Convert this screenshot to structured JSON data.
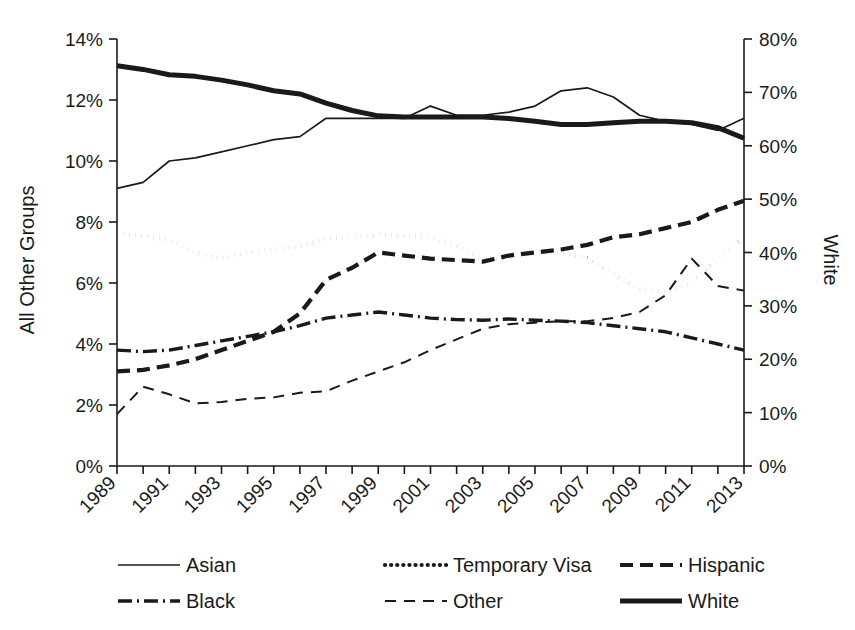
{
  "chart_data": {
    "type": "line",
    "title": "",
    "xlabel": "",
    "ylabel": "All Other Groups",
    "y2label": "White",
    "grid": false,
    "legend_position": "bottom",
    "x": [
      1989,
      1990,
      1991,
      1992,
      1993,
      1994,
      1995,
      1996,
      1997,
      1998,
      1999,
      2000,
      2001,
      2002,
      2003,
      2004,
      2005,
      2006,
      2007,
      2008,
      2009,
      2010,
      2011,
      2012,
      2013
    ],
    "xtick_labels": [
      "1989",
      "1991",
      "1993",
      "1995",
      "1997",
      "1999",
      "2001",
      "2003",
      "2005",
      "2007",
      "2009",
      "2011",
      "2013"
    ],
    "xlim": [
      1989,
      2013
    ],
    "ylim": [
      0,
      14
    ],
    "ytick_labels": [
      "0%",
      "2%",
      "4%",
      "6%",
      "8%",
      "10%",
      "12%",
      "14%"
    ],
    "ytick_values": [
      0,
      2,
      4,
      6,
      8,
      10,
      12,
      14
    ],
    "y2lim": [
      0,
      80
    ],
    "y2tick_labels": [
      "0%",
      "10%",
      "20%",
      "30%",
      "40%",
      "50%",
      "60%",
      "70%",
      "80%"
    ],
    "y2tick_values": [
      0,
      10,
      20,
      30,
      40,
      50,
      60,
      70,
      80
    ],
    "series": [
      {
        "name": "Asian",
        "axis": "left",
        "style": "solid-thin",
        "stroke_width": 1.7,
        "dash": "none",
        "values": [
          9.1,
          9.3,
          10.0,
          10.1,
          10.3,
          10.5,
          10.7,
          10.8,
          11.4,
          11.4,
          11.4,
          11.4,
          11.8,
          11.5,
          11.5,
          11.6,
          11.8,
          12.3,
          12.4,
          12.1,
          11.5,
          11.3,
          11.2,
          11.0,
          11.4
        ]
      },
      {
        "name": "Temporary Visa",
        "axis": "left",
        "style": "dotted",
        "stroke_width": 4.2,
        "dash": "0.1,6",
        "values": [
          7.6,
          7.55,
          7.4,
          7.0,
          6.8,
          7.0,
          7.1,
          7.2,
          7.45,
          7.5,
          7.6,
          7.55,
          7.5,
          7.2,
          6.8,
          6.85,
          7.0,
          7.0,
          6.8,
          6.3,
          5.8,
          5.7,
          6.0,
          6.8,
          7.5
        ]
      },
      {
        "name": "Hispanic",
        "axis": "left",
        "style": "dashed-thick",
        "stroke_width": 4.2,
        "dash": "13,7",
        "values": [
          3.1,
          3.15,
          3.3,
          3.5,
          3.8,
          4.1,
          4.4,
          5.0,
          6.1,
          6.5,
          7.0,
          6.9,
          6.8,
          6.75,
          6.7,
          6.9,
          7.0,
          7.1,
          7.25,
          7.5,
          7.6,
          7.8,
          8.0,
          8.4,
          8.7
        ]
      },
      {
        "name": "Black",
        "axis": "left",
        "style": "dash-dot",
        "stroke_width": 3.4,
        "dash": "14,5,2,5",
        "values": [
          3.8,
          3.75,
          3.8,
          3.95,
          4.1,
          4.25,
          4.4,
          4.6,
          4.85,
          4.95,
          5.05,
          4.95,
          4.85,
          4.8,
          4.78,
          4.82,
          4.78,
          4.75,
          4.7,
          4.6,
          4.5,
          4.4,
          4.2,
          4.0,
          3.8
        ]
      },
      {
        "name": "Other",
        "axis": "left",
        "style": "dashed-thin",
        "stroke_width": 2.0,
        "dash": "11,8",
        "values": [
          1.7,
          2.6,
          2.35,
          2.05,
          2.1,
          2.2,
          2.25,
          2.4,
          2.45,
          2.8,
          3.1,
          3.4,
          3.8,
          4.15,
          4.5,
          4.65,
          4.7,
          4.75,
          4.75,
          4.85,
          5.05,
          5.6,
          6.8,
          5.9,
          5.75
        ]
      },
      {
        "name": "White",
        "axis": "right",
        "style": "solid-thick",
        "stroke_width": 5.0,
        "dash": "none",
        "values": [
          75.0,
          74.3,
          73.3,
          73.0,
          72.3,
          71.4,
          70.3,
          69.7,
          68.0,
          66.6,
          65.6,
          65.4,
          65.4,
          65.4,
          65.4,
          65.1,
          64.6,
          64.0,
          64.0,
          64.3,
          64.6,
          64.6,
          64.3,
          63.4,
          61.4
        ]
      }
    ],
    "legend": [
      {
        "label": "Asian",
        "style": "solid-thin"
      },
      {
        "label": "Temporary Visa",
        "style": "dotted"
      },
      {
        "label": "Hispanic",
        "style": "dashed-thick"
      },
      {
        "label": "Black",
        "style": "dash-dot"
      },
      {
        "label": "Other",
        "style": "dashed-thin"
      },
      {
        "label": "White",
        "style": "solid-thick"
      }
    ],
    "colors": {
      "line": "#1a1a1a",
      "axis": "#1a1a1a",
      "background": "#ffffff"
    }
  }
}
